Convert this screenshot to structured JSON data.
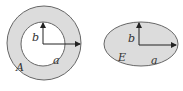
{
  "figures": [
    {
      "name": "annulus",
      "labels": {
        "inner_vertical": "b",
        "horizontal": "a",
        "region": "A"
      }
    },
    {
      "name": "ellipse",
      "labels": {
        "vertical": "b",
        "horizontal": "a",
        "region": "E"
      }
    }
  ],
  "colors": {
    "fill": "#dcdcdc",
    "stroke": "#666666",
    "arrow": "#222222",
    "background": "#ffffff"
  }
}
